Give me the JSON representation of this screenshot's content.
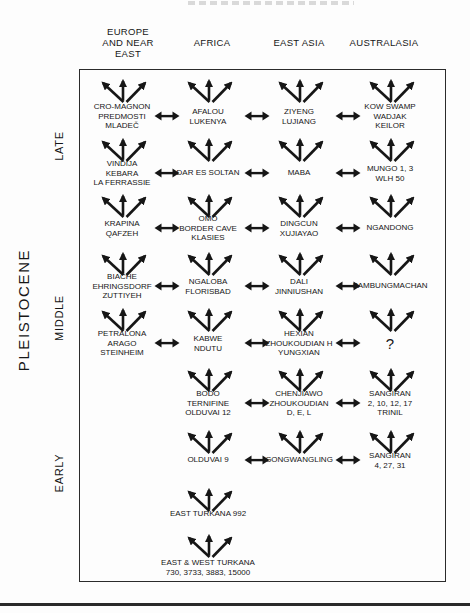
{
  "figure": {
    "epoch_axis": {
      "epoch_label": "PLEISTOCENE",
      "eras": [
        {
          "label": "LATE"
        },
        {
          "label": "MIDDLE"
        },
        {
          "label": "EARLY"
        }
      ]
    },
    "columns": [
      {
        "id": "europe-and-near-east",
        "header_lines": [
          "EUROPE",
          "AND NEAR",
          "EAST"
        ],
        "x": 122,
        "header_x": 128
      },
      {
        "id": "africa",
        "header_lines": [
          "AFRICA"
        ],
        "x": 208,
        "header_x": 212
      },
      {
        "id": "east-asia",
        "header_lines": [
          "EAST ASIA"
        ],
        "x": 299,
        "header_x": 299
      },
      {
        "id": "australasia",
        "header_lines": [
          "AUSTRALASIA"
        ],
        "x": 390,
        "header_x": 384
      }
    ],
    "gene_flow_x": [
      166.5,
      257,
      348
    ],
    "rows": [
      {
        "fan_y": 73,
        "label_y": 116,
        "gene_flow": [
          0,
          1,
          2
        ],
        "cells": [
          {
            "col": 0,
            "lines": [
              "CRO-MAGNON",
              "PREDMOSTI",
              "MLADEČ"
            ]
          },
          {
            "col": 1,
            "lines": [
              "AFALOU",
              "LUKENYA"
            ]
          },
          {
            "col": 2,
            "lines": [
              "ZIYENG",
              "LUJIANG"
            ]
          },
          {
            "col": 3,
            "lines": [
              "KOW SWAMP",
              "WADJAK",
              "KEILOR"
            ]
          }
        ]
      },
      {
        "fan_y": 132,
        "label_y": 173,
        "gene_flow": [
          0,
          1,
          2
        ],
        "cells": [
          {
            "col": 0,
            "lines": [
              "VINDIJA",
              "KEBARA",
              "LA FERRASSIE"
            ]
          },
          {
            "col": 1,
            "lines": [
              "DAR ES SOLTAN"
            ]
          },
          {
            "col": 2,
            "lines": [
              "MABA"
            ]
          },
          {
            "col": 3,
            "lines": [
              "MUNGO 1, 3",
              "WLH 50"
            ]
          }
        ]
      },
      {
        "fan_y": 188,
        "label_y": 228,
        "gene_flow": [
          0,
          1,
          2
        ],
        "cells": [
          {
            "col": 0,
            "lines": [
              "KRAPINA",
              "QAFZEH"
            ]
          },
          {
            "col": 1,
            "lines": [
              "OMO",
              "BORDER CAVE",
              "KLASIES"
            ]
          },
          {
            "col": 2,
            "lines": [
              "DINGCUN",
              "XUJIAYAO"
            ]
          },
          {
            "col": 3,
            "lines": [
              "NGANDONG"
            ]
          }
        ]
      },
      {
        "fan_y": 246,
        "label_y": 286,
        "gene_flow": [
          0,
          1,
          2
        ],
        "cells": [
          {
            "col": 0,
            "lines": [
              "BIACHE",
              "EHRINGSDORF",
              "ZUTTIYEH"
            ]
          },
          {
            "col": 1,
            "lines": [
              "NGALOBA",
              "FLORISBAD"
            ]
          },
          {
            "col": 2,
            "lines": [
              "DALI",
              "JINNIUSHAN"
            ]
          },
          {
            "col": 3,
            "lines": [
              "SAMBUNGMACHAN"
            ]
          }
        ]
      },
      {
        "fan_y": 302,
        "label_y": 343,
        "gene_flow": [
          0,
          1,
          2
        ],
        "cells": [
          {
            "col": 0,
            "lines": [
              "PETRALONA",
              "ARAGO",
              "STEINHEIM"
            ]
          },
          {
            "col": 1,
            "lines": [
              "KABWE",
              "NDUTU"
            ]
          },
          {
            "col": 2,
            "lines": [
              "HEXIAN",
              "ZHOUKOUDIAN H",
              "YUNGXIAN"
            ]
          },
          {
            "col": 3,
            "lines": [
              "?"
            ]
          }
        ]
      },
      {
        "fan_y": 362,
        "label_y": 403,
        "gene_flow": [
          1,
          2
        ],
        "cells": [
          {
            "col": 1,
            "lines": [
              "BODO",
              "TERNIFINE",
              "OLDUVAI 12"
            ]
          },
          {
            "col": 2,
            "lines": [
              "CHENJIAWO",
              "ZHOUKOUDIAN",
              "D, E, L"
            ]
          },
          {
            "col": 3,
            "lines": [
              "SANGIRAN",
              "2, 10, 12, 17",
              "TRINIL"
            ]
          }
        ]
      },
      {
        "fan_y": 424,
        "label_y": 460,
        "gene_flow": [
          1,
          2
        ],
        "cells": [
          {
            "col": 1,
            "lines": [
              "OLDUVAI 9"
            ]
          },
          {
            "col": 2,
            "lines": [
              "GONGWANGLING"
            ]
          },
          {
            "col": 3,
            "lines": [
              "SANGIRAN",
              "4, 27, 31"
            ]
          }
        ]
      },
      {
        "fan_y": 482,
        "label_y": 514,
        "gene_flow": [],
        "cells": [
          {
            "col": 1,
            "lines": [
              "EAST TURKANA 992"
            ]
          }
        ]
      },
      {
        "fan_y": 528,
        "label_y": 567,
        "gene_flow": [],
        "cells": [
          {
            "col": 1,
            "lines": [
              "EAST & WEST TURKANA",
              "730, 3733, 3883, 15000"
            ]
          }
        ]
      }
    ]
  },
  "icons": {
    "dispersal_fan": "three-upward-arrows",
    "gene_flow": "double-headed-horizontal-arrow"
  },
  "colors": {
    "ink": "#161616",
    "background": "#fdfdfd",
    "frame_border": "#2b2b2b",
    "remnant_gray": "#c6c6c6"
  }
}
